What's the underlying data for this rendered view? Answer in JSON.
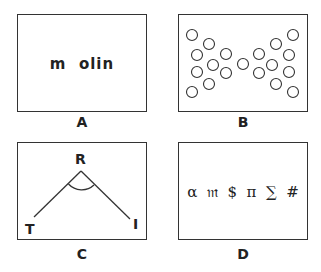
{
  "panels": {
    "A": {
      "caption": "A",
      "text": "m  olin"
    },
    "B": {
      "caption": "B",
      "description": "two mirrored triangles of circles forming a bow-tie shape",
      "circles": [
        [
          192,
          35
        ],
        [
          209,
          44
        ],
        [
          197,
          55
        ],
        [
          226,
          54
        ],
        [
          213,
          65
        ],
        [
          197,
          72
        ],
        [
          226,
          73
        ],
        [
          209,
          84
        ],
        [
          192,
          92
        ],
        [
          243,
          64
        ],
        [
          293,
          35
        ],
        [
          276,
          44
        ],
        [
          289,
          55
        ],
        [
          259,
          54
        ],
        [
          272,
          65
        ],
        [
          289,
          72
        ],
        [
          259,
          73
        ],
        [
          276,
          84
        ],
        [
          293,
          92
        ]
      ]
    },
    "C": {
      "caption": "C",
      "vertex_label": "R",
      "left_label": "T",
      "right_label": "I"
    },
    "D": {
      "caption": "D",
      "symbols": "α  𝔪  $  π  ∑  #"
    }
  }
}
